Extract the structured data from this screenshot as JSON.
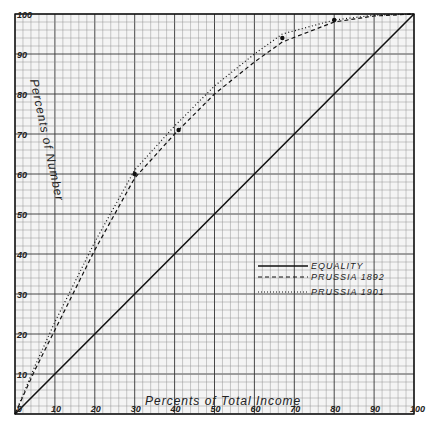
{
  "chart_data": {
    "type": "line",
    "title": "",
    "xlabel": "Percents of Total Income",
    "ylabel": "Percents of Number",
    "xlim": [
      0,
      100
    ],
    "ylim": [
      0,
      100
    ],
    "grid": true,
    "x_ticks": [
      "0",
      "10",
      "20",
      "30",
      "40",
      "50",
      "60",
      "70",
      "80",
      "90",
      "100"
    ],
    "y_ticks": [
      "10",
      "20",
      "30",
      "40",
      "50",
      "60",
      "70",
      "80",
      "90",
      "100"
    ],
    "legend_position": "center-right",
    "series": [
      {
        "name": "EQUALITY",
        "style": "solid",
        "x": [
          0,
          100
        ],
        "y": [
          0,
          100
        ]
      },
      {
        "name": "PRUSSIA 1892",
        "style": "dashed",
        "x": [
          0,
          5,
          10,
          20,
          30,
          40,
          50,
          60,
          67,
          80,
          90,
          100
        ],
        "y": [
          0,
          11,
          21,
          41,
          59,
          70,
          80,
          88,
          93,
          98,
          99.5,
          100
        ]
      },
      {
        "name": "PRUSSIA 1901",
        "style": "dotted",
        "x": [
          0,
          5,
          10,
          20,
          30,
          40,
          50,
          60,
          67,
          80,
          90,
          100
        ],
        "y": [
          0,
          12,
          23,
          43,
          61,
          72,
          82,
          90,
          95,
          98.5,
          99.7,
          100
        ]
      }
    ],
    "markers": [
      {
        "x": 30,
        "y": 60
      },
      {
        "x": 41,
        "y": 71
      },
      {
        "x": 67,
        "y": 94
      },
      {
        "x": 80,
        "y": 98.5
      }
    ]
  },
  "labels": {
    "x_title": "Percents of Total Income",
    "y_title": "Percents of Number",
    "legend": [
      "EQUALITY",
      "PRUSSIA 1892",
      "PRUSSIA 1901"
    ]
  }
}
